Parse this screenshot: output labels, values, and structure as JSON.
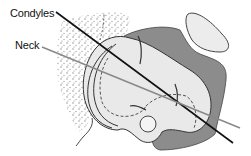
{
  "figure": {
    "labels": {
      "condyles": "Condyles",
      "neck": "Neck"
    },
    "colors": {
      "background": "#ffffff",
      "bone_light": "#e9e9e9",
      "bone_dark": "#8c8c8c",
      "stipple": "#9a9a9a",
      "outline": "#333333",
      "condyles_line": "#111111",
      "neck_line": "#888888"
    },
    "axes": [
      {
        "name": "condyles-axis",
        "from": [
          56,
          12
        ],
        "to": [
          233,
          143
        ]
      },
      {
        "name": "neck-axis",
        "from": [
          42,
          47
        ],
        "to": [
          240,
          128
        ]
      }
    ]
  }
}
